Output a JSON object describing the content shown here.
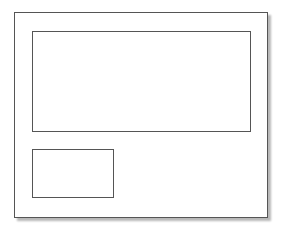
{
  "diagram": {
    "type": "wireframe-layout",
    "frame": {
      "label": ""
    },
    "regions": [
      {
        "id": "large-panel",
        "label": ""
      },
      {
        "id": "small-panel",
        "label": ""
      }
    ],
    "colors": {
      "stroke": "#555555",
      "fill": "#ffffff",
      "shadow": "#b8b8b8"
    }
  }
}
